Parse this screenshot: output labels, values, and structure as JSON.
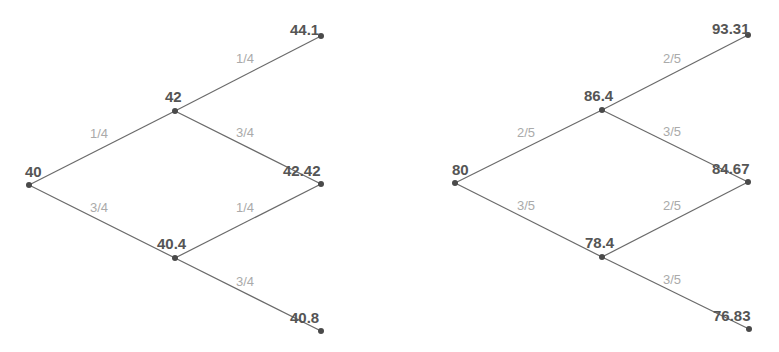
{
  "colors": {
    "edge": "#6a6a6a",
    "node": "#4a4a4a",
    "node_label": "#555555",
    "prob_label": "#aaaaaa",
    "background": "#ffffff"
  },
  "trees": [
    {
      "name": "left-tree",
      "nodes": [
        {
          "id": "root",
          "label": "40",
          "x": 29,
          "y": 185,
          "lx": 25,
          "ly": 177
        },
        {
          "id": "u",
          "label": "42",
          "x": 175,
          "y": 111,
          "lx": 165,
          "ly": 102
        },
        {
          "id": "d",
          "label": "40.4",
          "x": 175,
          "y": 258,
          "lx": 157,
          "ly": 249
        },
        {
          "id": "uu",
          "label": "44.1",
          "x": 321,
          "y": 36,
          "lx": 290,
          "ly": 35
        },
        {
          "id": "ud",
          "label": "42.42",
          "x": 321,
          "y": 184,
          "lx": 283,
          "ly": 176
        },
        {
          "id": "dd",
          "label": "40.8",
          "x": 321,
          "y": 331,
          "lx": 290,
          "ly": 323
        }
      ],
      "edges": [
        {
          "from": "root",
          "to": "u",
          "prob": "1/4",
          "px": 90,
          "py": 138
        },
        {
          "from": "root",
          "to": "d",
          "prob": "3/4",
          "px": 90,
          "py": 212
        },
        {
          "from": "u",
          "to": "uu",
          "prob": "1/4",
          "px": 236,
          "py": 63
        },
        {
          "from": "u",
          "to": "ud",
          "prob": "3/4",
          "px": 236,
          "py": 137
        },
        {
          "from": "d",
          "to": "ud",
          "prob": "1/4",
          "px": 236,
          "py": 212
        },
        {
          "from": "d",
          "to": "dd",
          "prob": "3/4",
          "px": 236,
          "py": 286
        }
      ]
    },
    {
      "name": "right-tree",
      "nodes": [
        {
          "id": "root",
          "label": "80",
          "x": 455,
          "y": 183,
          "lx": 452,
          "ly": 175
        },
        {
          "id": "u",
          "label": "86.4",
          "x": 602,
          "y": 110,
          "lx": 584,
          "ly": 101
        },
        {
          "id": "d",
          "label": "78.4",
          "x": 602,
          "y": 257,
          "lx": 585,
          "ly": 248
        },
        {
          "id": "uu",
          "label": "93.31",
          "x": 748,
          "y": 35,
          "lx": 712,
          "ly": 34
        },
        {
          "id": "ud",
          "label": "84.67",
          "x": 748,
          "y": 182,
          "lx": 712,
          "ly": 174
        },
        {
          "id": "dd",
          "label": "76.83",
          "x": 749,
          "y": 329,
          "lx": 713,
          "ly": 321
        }
      ],
      "edges": [
        {
          "from": "root",
          "to": "u",
          "prob": "2/5",
          "px": 517,
          "py": 137
        },
        {
          "from": "root",
          "to": "d",
          "prob": "3/5",
          "px": 517,
          "py": 210
        },
        {
          "from": "u",
          "to": "uu",
          "prob": "2/5",
          "px": 663,
          "py": 63
        },
        {
          "from": "u",
          "to": "ud",
          "prob": "3/5",
          "px": 663,
          "py": 136
        },
        {
          "from": "d",
          "to": "ud",
          "prob": "2/5",
          "px": 663,
          "py": 210
        },
        {
          "from": "d",
          "to": "dd",
          "prob": "3/5",
          "px": 663,
          "py": 284
        }
      ]
    }
  ]
}
